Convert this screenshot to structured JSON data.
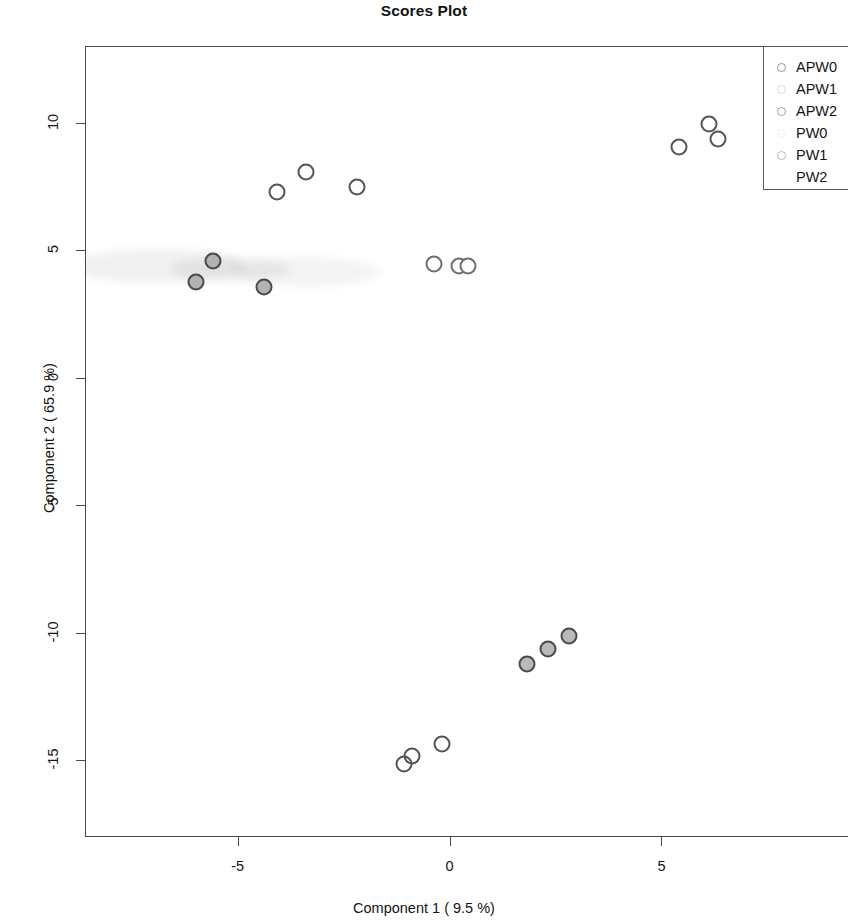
{
  "chart_data": {
    "type": "scatter",
    "title": "Scores Plot",
    "xlabel": "Component 1 ( 9.5 %)",
    "ylabel": "Component 2 ( 65.9 %)",
    "xlim": [
      -8.6,
      9.4
    ],
    "ylim": [
      -18.0,
      13.0
    ],
    "xticks": [
      -5,
      0,
      5
    ],
    "xticklabels": [
      "-5",
      "0",
      "5"
    ],
    "yticks": [
      -15,
      -10,
      -5,
      0,
      5,
      10
    ],
    "yticklabels": [
      "-15",
      "-10",
      "-5",
      "0",
      "5",
      "10"
    ],
    "grid": false,
    "legend_position": "top-right",
    "marker": "open-and-filled-circles",
    "series": [
      {
        "name": "APW0",
        "marker_fill": "none",
        "marker_edge": "#555555",
        "points": [
          {
            "x": 5.4,
            "y": 9.1
          },
          {
            "x": 6.1,
            "y": 10.0
          },
          {
            "x": 6.3,
            "y": 9.4
          }
        ]
      },
      {
        "name": "APW1",
        "marker_fill": "#ffffff",
        "marker_edge": "#6e6e6e",
        "points": [
          {
            "x": -0.4,
            "y": 4.5
          },
          {
            "x": 0.2,
            "y": 4.4
          },
          {
            "x": 0.4,
            "y": 4.4
          }
        ]
      },
      {
        "name": "APW2",
        "marker_fill": "none",
        "marker_edge": "#555555",
        "points": [
          {
            "x": -4.1,
            "y": 7.3
          },
          {
            "x": -3.4,
            "y": 8.1
          },
          {
            "x": -2.2,
            "y": 7.5
          }
        ]
      },
      {
        "name": "PW0",
        "marker_fill": "#b9b9b9",
        "marker_edge": "#4a4a4a",
        "points": [
          {
            "x": 1.8,
            "y": -11.2
          },
          {
            "x": 2.3,
            "y": -10.6
          },
          {
            "x": 2.8,
            "y": -10.1
          }
        ]
      },
      {
        "name": "PW1",
        "marker_fill": "none",
        "marker_edge": "#555555",
        "points": [
          {
            "x": -1.1,
            "y": -15.1
          },
          {
            "x": -0.9,
            "y": -14.8
          },
          {
            "x": -0.2,
            "y": -14.3
          }
        ]
      },
      {
        "name": "PW2",
        "marker_fill": "#b2b2b2",
        "marker_edge": "#4a4a4a",
        "points": [
          {
            "x": -6.0,
            "y": 3.8
          },
          {
            "x": -5.6,
            "y": 4.6
          },
          {
            "x": -4.4,
            "y": 3.6
          }
        ]
      }
    ]
  },
  "legend": {
    "items": [
      {
        "label": "APW0"
      },
      {
        "label": "APW1"
      },
      {
        "label": "APW2"
      },
      {
        "label": "PW0"
      },
      {
        "label": "PW1"
      },
      {
        "label": "PW2"
      }
    ]
  }
}
